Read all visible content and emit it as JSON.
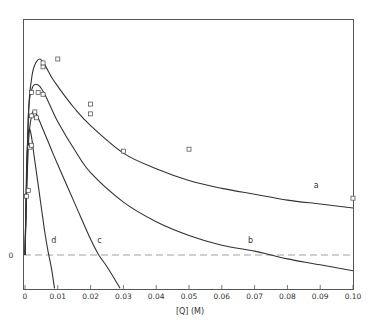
{
  "chart_data": {
    "type": "line",
    "title": "",
    "xlabel": "[Q]  (M)",
    "ylabel": "",
    "xlim": [
      0,
      0.1
    ],
    "ylim": [
      -17,
      120
    ],
    "x_ticks": [
      "0",
      "0.01",
      "0.02",
      "0.03",
      "0.04",
      "0.05",
      "0.06",
      "0.07",
      "0.08",
      "0.09",
      "0.10"
    ],
    "y_ticks": [
      "0"
    ],
    "grid": false,
    "zero_line": {
      "style": "dashed",
      "y": 0
    },
    "series": [
      {
        "name": "a",
        "x": [
          0,
          0.001,
          0.002,
          0.003,
          0.0045,
          0.006,
          0.008,
          0.01,
          0.015,
          0.02,
          0.03,
          0.04,
          0.05,
          0.06,
          0.07,
          0.08,
          0.09,
          0.1
        ],
        "y": [
          0,
          70,
          90,
          97,
          100,
          97,
          91,
          86,
          75,
          66,
          52,
          44,
          38,
          34,
          31,
          28,
          26,
          24
        ]
      },
      {
        "name": "b",
        "x": [
          0,
          0.001,
          0.002,
          0.003,
          0.0045,
          0.006,
          0.008,
          0.01,
          0.015,
          0.02,
          0.03,
          0.04,
          0.05,
          0.06,
          0.07,
          0.075,
          0.08,
          0.09,
          0.1
        ],
        "y": [
          0,
          70,
          84,
          87,
          86,
          82,
          75,
          68,
          54,
          42,
          27,
          17,
          10,
          5,
          2,
          0,
          -2,
          -5,
          -8
        ]
      },
      {
        "name": "c",
        "x": [
          0,
          0.001,
          0.002,
          0.003,
          0.004,
          0.006,
          0.008,
          0.01,
          0.015,
          0.02,
          0.0225,
          0.025,
          0.029
        ],
        "y": [
          0,
          55,
          71,
          73,
          70,
          62,
          54,
          46,
          27,
          8,
          0,
          -6,
          -17
        ]
      },
      {
        "name": "d",
        "x": [
          0,
          0.0005,
          0.001,
          0.0015,
          0.002,
          0.003,
          0.004,
          0.005,
          0.006,
          0.007,
          0.008,
          0.009
        ],
        "y": [
          0,
          45,
          62,
          64,
          60,
          48,
          36,
          24,
          12,
          2,
          -6,
          -17
        ]
      }
    ],
    "markers": {
      "shape": "open-square",
      "points": [
        {
          "x": 0.0005,
          "y": 30
        },
        {
          "x": 0.001,
          "y": 33
        },
        {
          "x": 0.0015,
          "y": 55
        },
        {
          "x": 0.002,
          "y": 56
        },
        {
          "x": 0.002,
          "y": 71
        },
        {
          "x": 0.003,
          "y": 73
        },
        {
          "x": 0.0035,
          "y": 70
        },
        {
          "x": 0.002,
          "y": 83
        },
        {
          "x": 0.004,
          "y": 83
        },
        {
          "x": 0.0055,
          "y": 82
        },
        {
          "x": 0.0055,
          "y": 96
        },
        {
          "x": 0.0055,
          "y": 98
        },
        {
          "x": 0.01,
          "y": 100
        },
        {
          "x": 0.02,
          "y": 77
        },
        {
          "x": 0.02,
          "y": 72
        },
        {
          "x": 0.03,
          "y": 53
        },
        {
          "x": 0.05,
          "y": 54
        },
        {
          "x": 0.1,
          "y": 29
        }
      ]
    },
    "annotations": [
      {
        "text": "a",
        "x": 0.088,
        "y": 34
      },
      {
        "text": "b",
        "x": 0.068,
        "y": 6
      },
      {
        "text": "c",
        "x": 0.022,
        "y": 6
      },
      {
        "text": "d",
        "x": 0.008,
        "y": 6
      }
    ]
  }
}
